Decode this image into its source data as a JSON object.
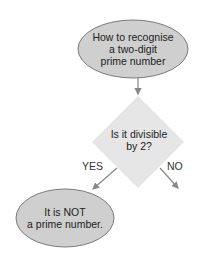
{
  "flowchart": {
    "start": {
      "text": "How to recognise a two-digit prime number",
      "lines": [
        "How to recognise",
        "a two-digit",
        "prime number"
      ]
    },
    "decision": {
      "text": "Is it divisible by 2?",
      "lines": [
        "Is it divisible",
        "by 2?"
      ]
    },
    "edges": {
      "yes_label": "YES",
      "no_label": "NO"
    },
    "yes_result": {
      "text": "It is NOT a prime number.",
      "lines": [
        "It is NOT",
        "a prime number."
      ]
    }
  },
  "colors": {
    "ellipse_fill": "#cfcfcf",
    "ellipse_stroke": "#7a7a7a",
    "diamond_fill": "#e6e6e6",
    "arrow": "#888888",
    "text": "#222222"
  }
}
